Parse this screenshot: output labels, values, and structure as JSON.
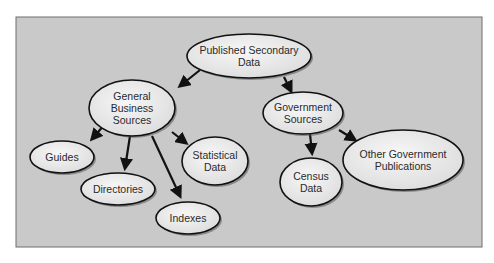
{
  "diagram": {
    "colors": {
      "panel_bg": "#c9c9c9",
      "panel_border": "#6e6e6e",
      "node_fill": "#efefef",
      "node_stroke": "#111111",
      "arrow": "#111111",
      "text": "#2a2a2a"
    },
    "nodes": [
      {
        "id": "published-secondary-data",
        "lines": [
          "Published Secondary",
          "Data"
        ]
      },
      {
        "id": "general-business-sources",
        "lines": [
          "General",
          "Business",
          "Sources"
        ]
      },
      {
        "id": "government-sources",
        "lines": [
          "Government",
          "Sources"
        ]
      },
      {
        "id": "guides",
        "lines": [
          "Guides"
        ]
      },
      {
        "id": "directories",
        "lines": [
          "Directories"
        ]
      },
      {
        "id": "indexes",
        "lines": [
          "Indexes"
        ]
      },
      {
        "id": "statistical-data",
        "lines": [
          "Statistical",
          "Data"
        ]
      },
      {
        "id": "census-data",
        "lines": [
          "Census",
          "Data"
        ]
      },
      {
        "id": "other-government-publications",
        "lines": [
          "Other Government",
          "Publications"
        ]
      }
    ],
    "edges": [
      {
        "from": "published-secondary-data",
        "to": "general-business-sources"
      },
      {
        "from": "published-secondary-data",
        "to": "government-sources"
      },
      {
        "from": "general-business-sources",
        "to": "guides"
      },
      {
        "from": "general-business-sources",
        "to": "directories"
      },
      {
        "from": "general-business-sources",
        "to": "indexes"
      },
      {
        "from": "general-business-sources",
        "to": "statistical-data"
      },
      {
        "from": "government-sources",
        "to": "census-data"
      },
      {
        "from": "government-sources",
        "to": "other-government-publications"
      }
    ]
  }
}
